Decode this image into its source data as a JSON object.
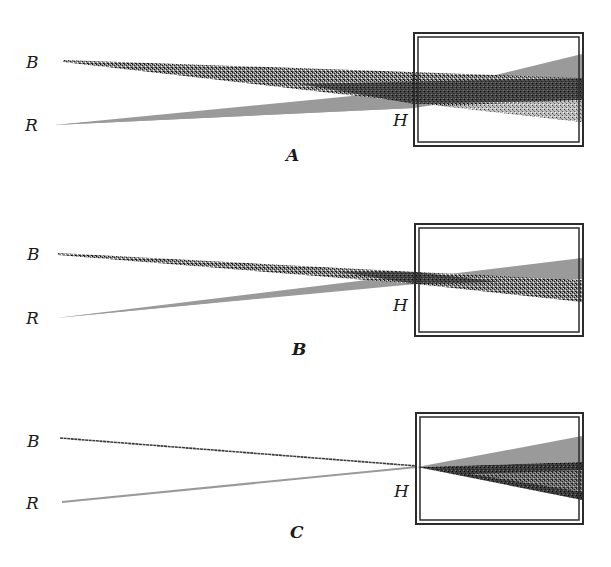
{
  "figure": {
    "colors": {
      "red_beam": "#9a9a9a",
      "blue_beam_stipple": "#2a2a2a",
      "box_stroke": "#2b2b2b",
      "background": "#ffffff"
    },
    "panels": [
      {
        "caption": "A",
        "labels": {
          "b": "B",
          "r": "R",
          "h": "H"
        },
        "box": {
          "x": 414,
          "y": 33,
          "w": 169,
          "h": 113
        },
        "b_beam": {
          "start": [
            63,
            61
          ],
          "end_top": [
            582,
            78
          ],
          "end_bottom": [
            582,
            122
          ]
        },
        "r_beam": {
          "start": [
            54,
            125
          ],
          "end_top": [
            582,
            54
          ],
          "end_bottom": [
            582,
            82
          ]
        }
      },
      {
        "caption": "B",
        "labels": {
          "b": "B",
          "r": "R",
          "h": "H"
        },
        "box": {
          "x": 415,
          "y": 224,
          "w": 168,
          "h": 112
        },
        "b_beam": {
          "start": [
            58,
            254
          ],
          "end_top": [
            582,
            280
          ],
          "end_bottom": [
            582,
            302
          ]
        },
        "r_beam": {
          "start": [
            56,
            318
          ],
          "end_top": [
            582,
            258
          ],
          "end_bottom": [
            582,
            279
          ]
        }
      },
      {
        "caption": "C",
        "labels": {
          "b": "B",
          "r": "R",
          "h": "H"
        },
        "box": {
          "x": 416,
          "y": 413,
          "w": 167,
          "h": 111
        },
        "b_beam": {
          "start": [
            60,
            438
          ],
          "end_top": [
            582,
            462
          ],
          "end_bottom": [
            582,
            500
          ]
        },
        "r_beam": {
          "start": [
            62,
            502
          ],
          "end_top": [
            582,
            436
          ],
          "end_bottom": [
            582,
            462
          ]
        }
      }
    ]
  }
}
